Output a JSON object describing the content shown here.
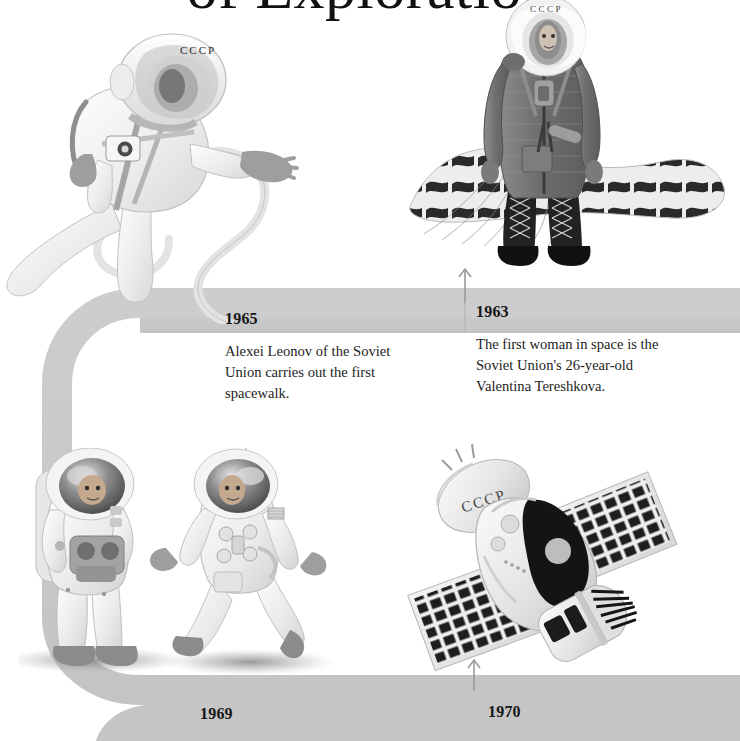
{
  "page": {
    "title": "of Exploration",
    "background_color": "#ffffff",
    "ribbon_color": "#c8c8c8",
    "ribbon_color_light": "#d2d2d2",
    "text_color": "#1d1d1d"
  },
  "timeline": {
    "events": [
      {
        "year": "1965",
        "text": "Alexei Leonov of the Soviet Union carries out the first spacewalk.",
        "illustration": "cosmonaut-spacewalk-leonov"
      },
      {
        "year": "1963",
        "text": "The first woman in space is the Soviet Union's 26-year-old Valentina Tereshkova.",
        "illustration": "cosmonaut-tereshkova-parachute"
      },
      {
        "year": "1969",
        "text": "",
        "illustration": "apollo-astronauts-moon"
      },
      {
        "year": "1970",
        "text": "",
        "illustration": "soviet-space-station-salyut"
      }
    ],
    "markers": [
      {
        "name": "arrow-1963",
        "year": "1963"
      },
      {
        "name": "arrow-1970",
        "year": "1970"
      }
    ]
  },
  "illustrations": {
    "leonov": {
      "helmet_text": "CCCP",
      "alt": "Cosmonaut Alexei Leonov floating in white spacesuit with tether and chest camera"
    },
    "tereshkova": {
      "helmet_text": "CCCP",
      "alt": "Valentina Tereshkova standing in dark flight suit and boots with parachute canopy behind"
    },
    "apollo": {
      "alt": "Two Apollo astronauts in white spacesuits walking on the lunar surface"
    },
    "salyut": {
      "hull_text": "CCCP",
      "alt": "Soviet space station with two solar panel arrays and engine nozzle"
    }
  }
}
